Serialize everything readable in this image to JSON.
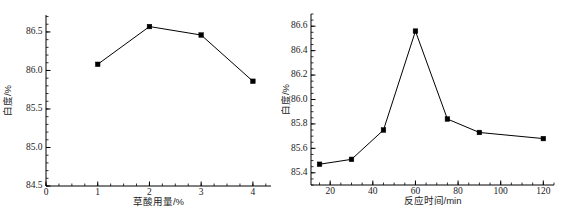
{
  "figure": {
    "panel_count": 2,
    "background": "#ffffff",
    "ink_color": "#000000"
  },
  "chart_data": [
    {
      "panel": "left",
      "type": "line",
      "title": "",
      "xlabel": "草酸用量/%",
      "ylabel": "白度/%",
      "x": [
        1,
        2,
        3,
        4
      ],
      "values": [
        86.08,
        86.57,
        86.46,
        85.86
      ],
      "series": [
        {
          "name": "白度",
          "x": [
            1,
            2,
            3,
            4
          ],
          "values": [
            86.08,
            86.57,
            86.46,
            85.86
          ]
        }
      ],
      "xlim": [
        0,
        4.35
      ],
      "ylim": [
        84.5,
        86.72
      ],
      "xticks": [
        0,
        1,
        2,
        3,
        4
      ],
      "xticklabels": [
        "0",
        "1",
        "2",
        "3",
        "4"
      ],
      "yticks": [
        84.5,
        85.0,
        85.5,
        86.0,
        86.5
      ],
      "yticklabels": [
        "84.5",
        "85.0",
        "85.5",
        "86.0",
        "86.5"
      ],
      "y_minor_step": 0.1,
      "x_minor_step": 0.25,
      "grid": false,
      "legend": "none",
      "marker": "square",
      "marker_filled": true
    },
    {
      "panel": "right",
      "type": "line",
      "title": "",
      "xlabel": "反应时间/min",
      "ylabel": "白度/%",
      "x": [
        15,
        30,
        45,
        60,
        75,
        90,
        120
      ],
      "values": [
        85.47,
        85.51,
        85.75,
        86.56,
        85.84,
        85.73,
        85.68
      ],
      "series": [
        {
          "name": "白度",
          "x": [
            15,
            30,
            45,
            60,
            75,
            90,
            120
          ],
          "values": [
            85.47,
            85.51,
            85.75,
            86.56,
            85.84,
            85.73,
            85.68
          ]
        }
      ],
      "xlim": [
        11,
        125
      ],
      "ylim": [
        85.3,
        86.7
      ],
      "xticks": [
        20,
        40,
        60,
        80,
        100,
        120
      ],
      "xticklabels": [
        "20",
        "40",
        "60",
        "80",
        "100",
        "120"
      ],
      "yticks": [
        85.4,
        85.6,
        85.8,
        86.0,
        86.2,
        86.4,
        86.6
      ],
      "yticklabels": [
        "85.4",
        "85.6",
        "85.8",
        "86.0",
        "86.2",
        "86.4",
        "86.6"
      ],
      "y_minor_step": 0.05,
      "x_minor_step": 5,
      "grid": false,
      "legend": "none",
      "marker": "square",
      "marker_filled": true
    }
  ]
}
